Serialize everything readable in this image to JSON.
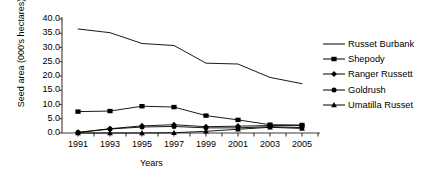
{
  "chart_data": {
    "type": "line",
    "title": "",
    "xlabel": "Years",
    "ylabel": "Seed area (000's hectares)",
    "x": [
      1991,
      1993,
      1995,
      1997,
      1999,
      2001,
      2003,
      2005
    ],
    "xtick_labels": [
      "1991",
      "1993",
      "1995",
      "1997",
      "1999",
      "2001",
      "2003",
      "2005"
    ],
    "ytick_labels": [
      "0.0",
      "5.0",
      "10.0",
      "15.0",
      "20.0",
      "25.0",
      "30.0",
      "35.0",
      "40.0"
    ],
    "ytick_values": [
      0,
      5,
      10,
      15,
      20,
      25,
      30,
      35,
      40
    ],
    "xlim": [
      1990,
      2006
    ],
    "ylim": [
      0,
      40
    ],
    "grid": false,
    "minor_xticks": true,
    "legend_position": "right",
    "series": [
      {
        "name": "Russet Burbank",
        "marker": "none",
        "color": "#000000",
        "values": [
          36.5,
          35.2,
          31.4,
          30.7,
          24.5,
          24.2,
          19.5,
          17.3
        ]
      },
      {
        "name": "Shepody",
        "marker": "square",
        "color": "#000000",
        "values": [
          7.5,
          7.7,
          9.4,
          9.1,
          6.1,
          4.6,
          2.9,
          2.8
        ]
      },
      {
        "name": "Ranger Russett",
        "marker": "diamond",
        "color": "#000000",
        "values": [
          0.2,
          1.5,
          2.5,
          2.9,
          2.2,
          2.4,
          2.6,
          2.6
        ]
      },
      {
        "name": "Goldrush",
        "marker": "circle",
        "color": "#000000",
        "values": [
          0.2,
          1.4,
          2.1,
          2.3,
          1.8,
          1.8,
          2.2,
          1.9
        ]
      },
      {
        "name": "Umatilla Russet",
        "marker": "triangle",
        "color": "#000000",
        "values": [
          0.0,
          0.0,
          0.0,
          0.1,
          0.6,
          1.3,
          2.0,
          1.6
        ]
      }
    ]
  }
}
